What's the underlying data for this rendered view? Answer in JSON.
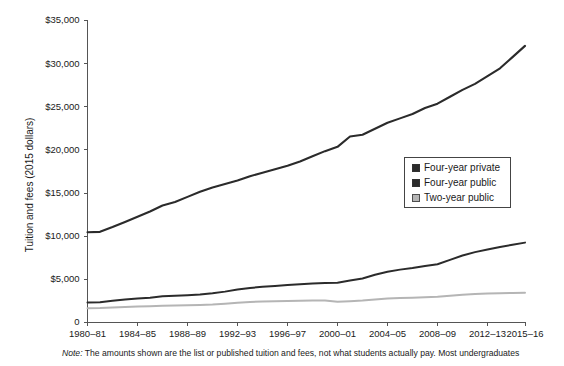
{
  "figure": {
    "note_prefix": "Note:",
    "note_text": " The amounts shown are the list or published tuition and fees, not what students actually pay. Most undergraduates"
  },
  "legend": {
    "position": "right-middle",
    "items": [
      {
        "label": "Four-year private",
        "color": "#2b2b2b"
      },
      {
        "label": "Four-year public",
        "color": "#2b2b2b"
      },
      {
        "label": "Two-year public",
        "color": "#b5b5b5"
      }
    ]
  },
  "chart_data": {
    "type": "line",
    "title": "",
    "xlabel": "",
    "ylabel": "Tuition and fees (2015 dollars)",
    "ylim": [
      0,
      35000
    ],
    "yticks": [
      0,
      5000,
      10000,
      15000,
      20000,
      25000,
      30000,
      35000
    ],
    "ytick_labels": [
      "0",
      "$5,000",
      "$10,000",
      "$15,000",
      "$20,000",
      "$25,000",
      "$30,000",
      "$35,000"
    ],
    "xlim": [
      1980,
      2015
    ],
    "xticks": [
      1980,
      1984,
      1988,
      1992,
      1996,
      2000,
      2004,
      2008,
      2012,
      2015
    ],
    "xtick_labels": [
      "1980–81",
      "1984–85",
      "1988–89",
      "1992–93",
      "1996–97",
      "2000–01",
      "2004–05",
      "2008–09",
      "2012–13",
      "2015–16"
    ],
    "grid": false,
    "x": [
      1980,
      1981,
      1982,
      1983,
      1984,
      1985,
      1986,
      1987,
      1988,
      1989,
      1990,
      1991,
      1992,
      1993,
      1994,
      1995,
      1996,
      1997,
      1998,
      1999,
      2000,
      2001,
      2002,
      2003,
      2004,
      2005,
      2006,
      2007,
      2008,
      2009,
      2010,
      2011,
      2012,
      2013,
      2014,
      2015
    ],
    "series": [
      {
        "name": "Four-year private",
        "color": "#2b2b2b",
        "width": 2.1,
        "values": [
          10400,
          10450,
          11000,
          11600,
          12200,
          12800,
          13500,
          13900,
          14500,
          15100,
          15600,
          16000,
          16400,
          16900,
          17300,
          17700,
          18100,
          18600,
          19200,
          19800,
          20300,
          21500,
          21700,
          22400,
          23100,
          23600,
          24100,
          24800,
          25300,
          26100,
          26900,
          27600,
          28500,
          29400,
          30700,
          32000
        ]
      },
      {
        "name": "Four-year public",
        "color": "#2b2b2b",
        "width": 2.0,
        "values": [
          2270,
          2300,
          2450,
          2600,
          2720,
          2820,
          2980,
          3030,
          3100,
          3180,
          3330,
          3520,
          3760,
          3950,
          4080,
          4180,
          4280,
          4380,
          4470,
          4510,
          4560,
          4800,
          5050,
          5480,
          5820,
          6070,
          6260,
          6500,
          6700,
          7200,
          7700,
          8100,
          8400,
          8700,
          8950,
          9200
        ]
      },
      {
        "name": "Two-year public",
        "color": "#b5b5b5",
        "width": 2.0,
        "values": [
          1600,
          1620,
          1680,
          1740,
          1790,
          1830,
          1880,
          1910,
          1950,
          1980,
          2030,
          2120,
          2240,
          2320,
          2370,
          2400,
          2430,
          2460,
          2480,
          2480,
          2340,
          2400,
          2480,
          2620,
          2720,
          2780,
          2820,
          2880,
          2930,
          3050,
          3170,
          3250,
          3300,
          3340,
          3360,
          3400
        ]
      }
    ]
  }
}
